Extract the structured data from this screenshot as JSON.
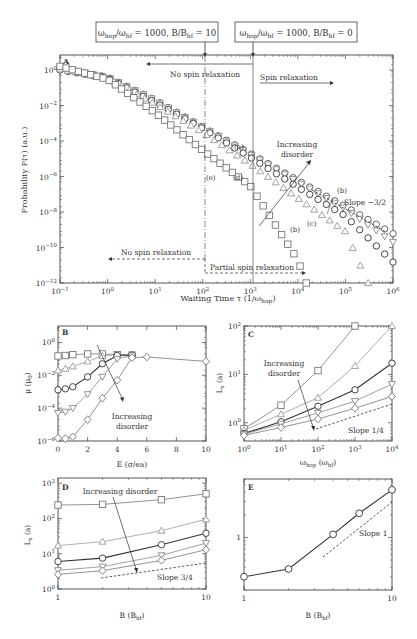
{
  "callouts": {
    "left": "ωhop/ωhf = 1000, B/Bhf = 10",
    "right": "ωhop/ωhf = 1000, B/Bhf = 0"
  },
  "chart_data": [
    {
      "panel": "A",
      "type": "scatter",
      "xscale": "log",
      "yscale": "log",
      "xlabel": "Waiting Time τ (1/ωhop)",
      "ylabel": "Probability P(τ) (a.u.)",
      "xlim": [
        0.1,
        1000000
      ],
      "ylim": [
        1e-12,
        7
      ],
      "xticks": [
        "10^-1",
        "10^0",
        "10^1",
        "10^2",
        "10^3",
        "10^4",
        "10^5",
        "10^6"
      ],
      "yticks": [
        "10^0",
        "10^-2",
        "10^-4",
        "10^-6",
        "10^-8",
        "10^-10",
        "10^-12"
      ],
      "annotations": [
        "No spin relaxation",
        "Spin relaxation",
        "No spin relaxation",
        "Partial spin relaxation",
        "Increasing disorder",
        "Slope −3/2",
        "(a)",
        "(b)",
        "(b)",
        "(c)",
        "(d)",
        "(e)",
        "(b)"
      ],
      "series": [
        {
          "name": "(a)",
          "marker": "circle",
          "color": "#555",
          "x": [
            0.1,
            1,
            10,
            100,
            1000,
            10000,
            100000,
            1000000
          ],
          "y": [
            1.2,
            0.4,
            0.02,
            0.0006,
            2e-05,
            6e-07,
            2e-08,
            6e-10
          ]
        },
        {
          "name": "(b)",
          "marker": "triangle-down",
          "color": "#888",
          "x": [
            0.1,
            1,
            10,
            100,
            1000,
            10000,
            100000,
            1000000
          ],
          "y": [
            1.2,
            0.4,
            0.02,
            0.0006,
            1.8e-05,
            5e-07,
            1.5e-08,
            2e-10
          ]
        },
        {
          "name": "(c)",
          "marker": "circle",
          "color": "#333",
          "x": [
            0.1,
            1,
            10,
            100,
            1000,
            10000,
            100000,
            1000000
          ],
          "y": [
            1.0,
            0.35,
            0.015,
            0.0005,
            1.2e-05,
            2.5e-07,
            6e-09,
            1.5e-11
          ]
        },
        {
          "name": "(d)",
          "marker": "triangle-up",
          "color": "#999",
          "x": [
            0.1,
            1,
            10,
            100,
            1000,
            10000,
            100000,
            300000
          ],
          "y": [
            1.1,
            0.35,
            0.012,
            0.0003,
            5e-06,
            6e-08,
            8e-10,
            1e-12
          ]
        },
        {
          "name": "(e)",
          "marker": "square",
          "color": "#777",
          "x": [
            0.1,
            1,
            10,
            100,
            1000,
            10000,
            15000
          ],
          "y": [
            1.6,
            0.3,
            0.004,
            3e-05,
            3e-07,
            2e-11,
            1e-12
          ]
        }
      ]
    },
    {
      "panel": "B",
      "type": "line",
      "xscale": "linear",
      "yscale": "log",
      "xlabel": "E (σ/ea)",
      "ylabel": "μ (μ0)",
      "xlim": [
        0,
        10
      ],
      "ylim": [
        1e-06,
        10
      ],
      "xticks": [
        "0",
        "2",
        "4",
        "6",
        "8",
        "10"
      ],
      "yticks": [
        "10^0",
        "10^-2",
        "10^-4",
        "10^-6"
      ],
      "annotations": [
        "Increasing disorder"
      ],
      "series": [
        {
          "marker": "square",
          "color": "#777",
          "x": [
            0,
            0.5,
            1,
            2,
            3,
            4,
            5
          ],
          "y": [
            0.15,
            0.16,
            0.18,
            0.2,
            0.2,
            0.18,
            0.17
          ]
        },
        {
          "marker": "triangle-up",
          "color": "#999",
          "x": [
            0,
            0.5,
            1,
            2,
            3,
            4,
            5
          ],
          "y": [
            0.02,
            0.025,
            0.035,
            0.07,
            0.15,
            0.18,
            0.17
          ]
        },
        {
          "marker": "circle",
          "color": "#333",
          "x": [
            0,
            0.5,
            1,
            2,
            3,
            4,
            5
          ],
          "y": [
            0.0013,
            0.0015,
            0.002,
            0.008,
            0.05,
            0.16,
            0.17
          ]
        },
        {
          "marker": "triangle-down",
          "color": "#888",
          "x": [
            0,
            0.5,
            1,
            2,
            3,
            4,
            5
          ],
          "y": [
            5e-05,
            6e-05,
            0.0001,
            0.0007,
            0.008,
            0.1,
            0.16
          ]
        },
        {
          "marker": "diamond",
          "color": "#777",
          "x": [
            0,
            0.5,
            1,
            2,
            3,
            4,
            5,
            6,
            10
          ],
          "y": [
            1.5e-06,
            1.4e-06,
            1.8e-06,
            2e-05,
            0.0004,
            0.005,
            0.12,
            0.13,
            0.07
          ]
        }
      ]
    },
    {
      "panel": "C",
      "type": "line",
      "xscale": "log",
      "yscale": "log",
      "xlabel": "ωhop (ωhf)",
      "ylabel": "Ls (a)",
      "xlim": [
        1,
        10000
      ],
      "ylim": [
        0.42,
        100
      ],
      "xticks": [
        "10^0",
        "10^1",
        "10^2",
        "10^3",
        "10^4"
      ],
      "yticks": [
        "10^0",
        "10^1",
        "10^2"
      ],
      "annotations": [
        "Increasing disorder",
        "Slope 1/4"
      ],
      "series": [
        {
          "marker": "square",
          "color": "#777",
          "x": [
            1,
            10,
            100,
            1000
          ],
          "y": [
            0.75,
            2.3,
            12,
            100
          ]
        },
        {
          "marker": "triangle-up",
          "color": "#999",
          "x": [
            1,
            10,
            100,
            1000,
            10000
          ],
          "y": [
            0.7,
            1.5,
            3.3,
            15,
            100
          ]
        },
        {
          "marker": "circle",
          "color": "#333",
          "x": [
            1,
            10,
            100,
            1000,
            10000
          ],
          "y": [
            0.6,
            1.05,
            2.2,
            4.8,
            17
          ]
        },
        {
          "marker": "triangle-down",
          "color": "#888",
          "x": [
            1,
            10,
            100,
            1000,
            10000
          ],
          "y": [
            0.58,
            0.95,
            1.6,
            2.8,
            6.3
          ]
        },
        {
          "marker": "diamond",
          "color": "#777",
          "x": [
            1,
            10,
            100,
            1000,
            10000
          ],
          "y": [
            0.55,
            0.8,
            1.2,
            2.0,
            3.5
          ]
        }
      ]
    },
    {
      "panel": "D",
      "type": "line",
      "xscale": "log",
      "yscale": "log",
      "xlabel": "B (Bhf)",
      "ylabel": "Ls (a)",
      "xlim": [
        1,
        10
      ],
      "ylim": [
        1,
        1400
      ],
      "xticks": [
        "1",
        "10"
      ],
      "yticks": [
        "10^0",
        "10^1",
        "10^2",
        "10^3"
      ],
      "annotations": [
        "Increasing disorder",
        "Slope 3/4"
      ],
      "series": [
        {
          "marker": "square",
          "color": "#777",
          "x": [
            1,
            2,
            5,
            10
          ],
          "y": [
            240,
            250,
            340,
            500
          ]
        },
        {
          "marker": "triangle-up",
          "color": "#999",
          "x": [
            1,
            2,
            5,
            10
          ],
          "y": [
            17,
            22,
            45,
            95
          ]
        },
        {
          "marker": "circle",
          "color": "#333",
          "x": [
            1,
            2,
            5,
            10
          ],
          "y": [
            6,
            7.5,
            18,
            38
          ]
        },
        {
          "marker": "triangle-down",
          "color": "#888",
          "x": [
            1,
            2,
            5,
            10
          ],
          "y": [
            3.4,
            4.3,
            9,
            20
          ]
        },
        {
          "marker": "diamond",
          "color": "#777",
          "x": [
            1,
            2,
            5,
            10
          ],
          "y": [
            2.6,
            3.3,
            6.5,
            13
          ]
        }
      ]
    },
    {
      "panel": "E",
      "type": "line",
      "xscale": "log",
      "yscale": "log",
      "xlabel": "B (Bhf)",
      "ylabel": "",
      "xlim": [
        1,
        10
      ],
      "ylim": [
        0.2,
        6
      ],
      "xticks": [
        "1",
        "10"
      ],
      "yticks": [
        "1"
      ],
      "annotations": [
        "Slope 1"
      ],
      "series": [
        {
          "marker": "circle",
          "color": "#333",
          "x": [
            1,
            2,
            4,
            6,
            10
          ],
          "y": [
            0.3,
            0.38,
            1.1,
            2.1,
            4.3
          ]
        }
      ]
    }
  ],
  "labels": {
    "panelA": "A",
    "panelB": "B",
    "panelC": "C",
    "panelD": "D",
    "panelE": "E",
    "noSpin1": "No spin relaxation",
    "spin": "Spin relaxation",
    "noSpin2": "No spin relaxation",
    "partial": "Partial spin relaxation",
    "incDisA1": "Increasing",
    "incDisA2": "disorder",
    "slopeA": "Slope −3/2",
    "incDisB1": "Increasing",
    "incDisB2": "disorder",
    "incDisC1": "Increasing",
    "incDisC2": "disorder",
    "slopeC": "Slope 1/4",
    "incDisD": "Increasing disorder",
    "slopeD": "Slope 3/4",
    "slopeE": "Slope 1",
    "a": "(a)",
    "b1": "(b)",
    "b2": "(b)",
    "c": "(c)",
    "d": "(d)",
    "e": "(e)",
    "xlabelA": "Waiting Time τ (1/ω",
    "xlabelA_sub": "hop",
    "ylabelA": "Probability P(τ) (a.u.)",
    "xlabelB": "E (σ/ea)",
    "ylabelB": "μ (μ",
    "xlabelC": "ω",
    "ylabelC": "L",
    "xlabelD": "B (B",
    "xlabelE": "B (B"
  }
}
